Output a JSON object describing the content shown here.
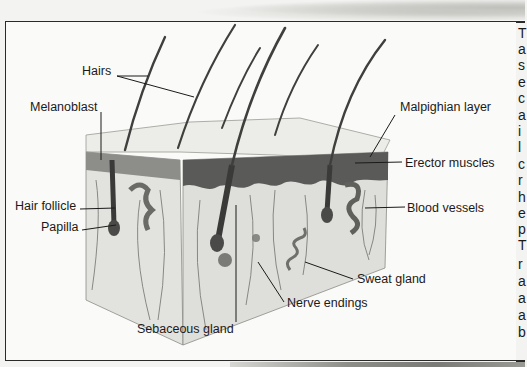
{
  "diagram": {
    "labels": [
      {
        "id": "hairs",
        "text": "Hairs",
        "x": 82,
        "y": 64
      },
      {
        "id": "melanoblast",
        "text": "Melanoblast",
        "x": 30,
        "y": 100
      },
      {
        "id": "malpighian-layer",
        "text": "Malpighian layer",
        "x": 400,
        "y": 100
      },
      {
        "id": "erector-muscles",
        "text": "Erector muscles",
        "x": 405,
        "y": 156
      },
      {
        "id": "hair-follicle",
        "text": "Hair follicle",
        "x": 15,
        "y": 199
      },
      {
        "id": "blood-vessels",
        "text": "Blood vessels",
        "x": 407,
        "y": 201
      },
      {
        "id": "papilla",
        "text": "Papilla",
        "x": 41,
        "y": 220
      },
      {
        "id": "sweat-gland",
        "text": "Sweat gland",
        "x": 357,
        "y": 272
      },
      {
        "id": "nerve-endings",
        "text": "Nerve endings",
        "x": 287,
        "y": 296
      },
      {
        "id": "sebaceous-gland",
        "text": "Sebaceous gland",
        "x": 137,
        "y": 322
      }
    ]
  },
  "side_text": {
    "visible_letters": [
      "T",
      "a",
      "s",
      "e",
      "c",
      "a",
      "i",
      "l",
      "c",
      "r",
      "h",
      "e",
      "p",
      "T",
      "r",
      "a",
      "a",
      "a",
      "b"
    ]
  },
  "colors": {
    "page": "#f3f3f1",
    "frame_border": "#2a2a2a",
    "text": "#1a1a1a",
    "epidermis_dark": "#5a5a58",
    "dermis": "#dcdcd8"
  }
}
